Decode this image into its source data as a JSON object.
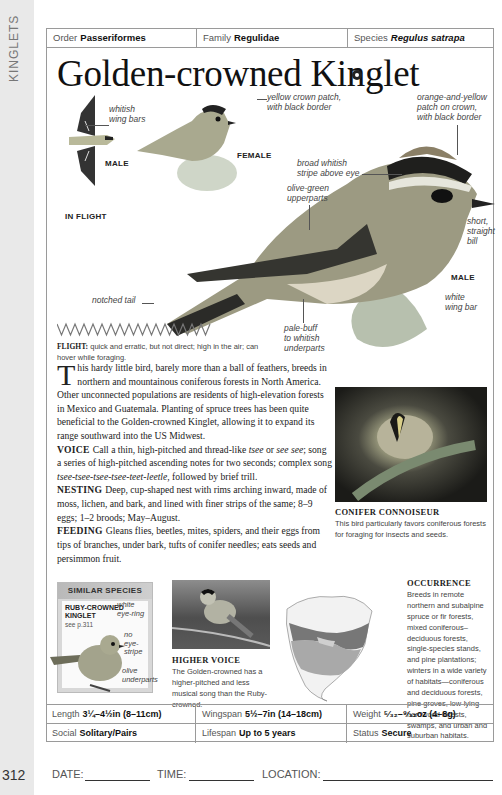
{
  "side_tab": {
    "label": "KINGLETS"
  },
  "page_number": "312",
  "header": {
    "order_label": "Order",
    "order_value": "Passeriformes",
    "family_label": "Family",
    "family_value": "Regulidae",
    "species_label": "Species",
    "species_value": "Regulus satrapa"
  },
  "title": "Golden-crowned Kinglet",
  "sound_icon": "sound-icon",
  "annotations": {
    "whitish_wing_bars": [
      "whitish",
      "wing bars"
    ],
    "male_small": "MALE",
    "in_flight": "IN FLIGHT",
    "yellow_crown": [
      "yellow crown patch,",
      "with black border"
    ],
    "female": "FEMALE",
    "orange_yellow_crown": [
      "orange-and-yellow",
      "patch on crown,",
      "with black border"
    ],
    "broad_stripe": [
      "broad whitish",
      "stripe above eye"
    ],
    "olive_upperparts": [
      "olive-green",
      "upperparts"
    ],
    "short_bill": [
      "short,",
      "straight",
      "bill"
    ],
    "male_main": "MALE",
    "white_wing_bar": [
      "white",
      "wing bar"
    ],
    "notched_tail": "notched tail",
    "pale_buff": [
      "pale-buff",
      "to whitish",
      "underparts"
    ]
  },
  "flight": {
    "label": "FLIGHT:",
    "text": "quick and erratic, but not direct; high in the air; can hover while foraging."
  },
  "description": {
    "drop_cap": "T",
    "intro": "his hardy little bird, barely more than a ball of feathers, breeds in northern and mountainous coniferous forests in North America. Other unconnected populations are residents of high-elevation forests in Mexico and Guatemala. Planting of spruce trees has been quite beneficial to the Golden-crowned Kinglet, allowing it to expand its range southward into the US Midwest.",
    "voice_label": "VOICE",
    "voice_a": "Call a thin, high-pitched and thread-like ",
    "voice_i1": "tsee",
    "voice_b": " or ",
    "voice_i2": "see see",
    "voice_c": "; song a series of high-pitched ascending notes for two seconds; complex song ",
    "voice_i3": "tsee-tsee-tsee-tsee-teet-leetle",
    "voice_d": ", followed by brief trill.",
    "nesting_label": "NESTING",
    "nesting_text": "Deep, cup-shaped nest with rims arching inward, made of moss, lichen, and bark, and lined with finer strips of the same; 8–9 eggs; 1–2 broods; May–August.",
    "feeding_label": "FEEDING",
    "feeding_text": "Gleans flies, beetles, mites, spiders, and their eggs from tips of branches, under bark, tufts of conifer needles; eats seeds and persimmon fruit."
  },
  "conifer": {
    "heading": "CONIFER CONNOISEUR",
    "text": "This bird particularly favors coniferous forests for foraging for insects and seeds."
  },
  "similar_species": {
    "heading": "SIMILAR SPECIES",
    "name_line1": "RUBY-CROWNED",
    "name_line2": "KINGLET",
    "see": "see p.311",
    "notes": {
      "eye_ring": [
        "white",
        "eye-ring"
      ],
      "no_stripe": [
        "no eye-",
        "stripe"
      ],
      "olive_under": [
        "olive",
        "underparts"
      ]
    }
  },
  "higher_voice": {
    "heading": "HIGHER VOICE",
    "text": "The Golden-crowned has a higher-pitched and less musical song than the Ruby-crowned."
  },
  "occurrence": {
    "heading": "OCCURRENCE",
    "text": "Breeds in remote northern and subalpine spruce or fir forests, mixed coniferous–deciduous forests, single-species stands, and pine plantations; winters in a wide variety of habitats—coniferous and deciduous forests, pine groves, low-lying hardwood forests, swamps, and urban and suburban habitats."
  },
  "stats": {
    "rows": [
      [
        {
          "label": "Length",
          "value": "3¼–4½in (8–11cm)"
        },
        {
          "label": "Wingspan",
          "value": "5½–7in (14–18cm)"
        },
        {
          "label": "Weight",
          "value": "⁵⁄₃₂–⁹⁄₃₂oz (4–8g)"
        }
      ],
      [
        {
          "label": "Social",
          "value": "Solitary/Pairs"
        },
        {
          "label": "Lifespan",
          "value": "Up to 5 years"
        },
        {
          "label": "Status",
          "value": "Secure"
        }
      ]
    ]
  },
  "log": {
    "date": "DATE:",
    "time": "TIME:",
    "location": "LOCATION:"
  }
}
